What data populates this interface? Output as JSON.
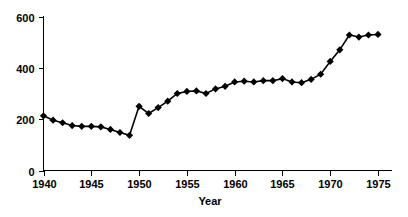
{
  "chart_data": {
    "type": "line",
    "title": "",
    "subtitle": "",
    "xlabel": "Year",
    "ylabel": "",
    "xlim": [
      1939,
      1976
    ],
    "ylim": [
      0,
      600
    ],
    "xticks": [
      1940,
      1945,
      1950,
      1955,
      1960,
      1965,
      1970,
      1975
    ],
    "xtick_labels": [
      "1940",
      "1945",
      "1950",
      "1955",
      "1960",
      "1965",
      "1970",
      "1975"
    ],
    "yticks": [
      0,
      200,
      400,
      600
    ],
    "ytick_labels": [
      "0",
      "200",
      "400",
      "600"
    ],
    "grid": false,
    "legend": false,
    "legend_position": "none",
    "marker": "diamond",
    "marker_color": "#000000",
    "line_color": "#000000",
    "x": [
      1940,
      1941,
      1942,
      1943,
      1944,
      1945,
      1946,
      1947,
      1948,
      1949,
      1950,
      1951,
      1952,
      1953,
      1954,
      1955,
      1956,
      1957,
      1958,
      1959,
      1960,
      1961,
      1962,
      1963,
      1964,
      1965,
      1966,
      1967,
      1968,
      1969,
      1970,
      1971,
      1972,
      1973,
      1974,
      1975
    ],
    "values": [
      213,
      196,
      186,
      175,
      172,
      172,
      170,
      160,
      148,
      137,
      250,
      222,
      245,
      270,
      300,
      308,
      310,
      300,
      318,
      328,
      345,
      348,
      345,
      350,
      350,
      358,
      345,
      342,
      355,
      375,
      425,
      470,
      528,
      520,
      528,
      530
    ],
    "series": [
      {
        "name": "series-1",
        "values": [
          213,
          196,
          186,
          175,
          172,
          172,
          170,
          160,
          148,
          137,
          250,
          222,
          245,
          270,
          300,
          308,
          310,
          300,
          318,
          328,
          345,
          348,
          345,
          350,
          350,
          358,
          345,
          342,
          355,
          375,
          425,
          470,
          528,
          520,
          528,
          530
        ]
      }
    ]
  },
  "axes": {
    "x_axis_title": "Year",
    "y_axis_title": ""
  }
}
